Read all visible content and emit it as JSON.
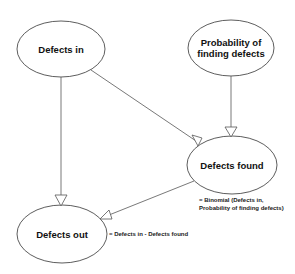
{
  "diagram": {
    "nodes": [
      {
        "id": "defects_in",
        "label": "Defects in"
      },
      {
        "id": "probability",
        "label": "Probability of finding defects"
      },
      {
        "id": "defects_found",
        "label": "Defects found"
      },
      {
        "id": "defects_out",
        "label": "Defects out"
      }
    ],
    "edges": [
      {
        "from": "defects_in",
        "to": "defects_out"
      },
      {
        "from": "defects_in",
        "to": "defects_found"
      },
      {
        "from": "probability",
        "to": "defects_found"
      },
      {
        "from": "defects_found",
        "to": "defects_out"
      }
    ],
    "formulas": {
      "defects_found_line1": "= Binomial (Defects in,",
      "defects_found_line2": "Probability of finding defects)",
      "defects_out": "= Defects in - Defects found"
    }
  }
}
